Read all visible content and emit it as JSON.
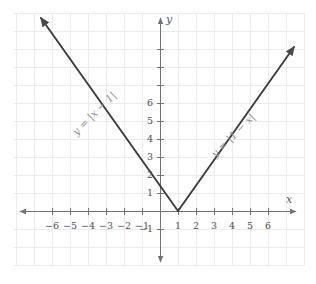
{
  "chart_data": {
    "type": "line",
    "title": "",
    "xlabel": "x",
    "ylabel": "y",
    "xlim": [
      -7.1,
      7.5
    ],
    "ylim": [
      -1.8,
      7.2
    ],
    "grid": true,
    "unit_px": 18,
    "origin_px": {
      "x": 160,
      "y": 211
    },
    "x_ticks": [
      -6,
      -5,
      -4,
      -3,
      -2,
      -1,
      1,
      2,
      3,
      4,
      5,
      6
    ],
    "x_tick_labels": [
      "−6",
      "−5",
      "−4",
      "−3",
      "−2",
      "−1",
      "1",
      "2",
      "3",
      "4",
      "5",
      "6"
    ],
    "y_ticks": [
      -1,
      1,
      2,
      3,
      4,
      5,
      6
    ],
    "y_tick_labels": [
      "−1",
      "1",
      "2",
      "3",
      "4",
      "5",
      "6"
    ],
    "series": [
      {
        "name": "y = |x − 1|",
        "expression": "y = |x - 1|",
        "color": "#3c3c3c",
        "vertex": [
          1,
          0
        ],
        "points": [
          [
            -5.8,
            6.8
          ],
          [
            1,
            0
          ],
          [
            7.5,
            6.5
          ]
        ],
        "arrow_start": true,
        "arrow_end": true
      }
    ],
    "annotations": [
      {
        "id": "eq-left",
        "text": "y = |x − 1|",
        "x": -4.0,
        "y": 4.2,
        "rotation_deg": -45,
        "color": "#8f9397"
      },
      {
        "id": "eq-right",
        "text": "y = |1 − x|",
        "x": 3.1,
        "y": 3.2,
        "rotation_deg": 45,
        "color": "#8f9397"
      }
    ],
    "colors": {
      "grid": "#ececf0",
      "axis": "#6f7479",
      "curve": "#3c3c3c",
      "tick_text": "#4b5055",
      "annotation_text": "#8f9397",
      "background": "#ffffff"
    }
  },
  "axis_labels": {
    "x": "x",
    "y": "y"
  },
  "equations": {
    "left": "y = |x − 1|",
    "right": "y = |1 − x|"
  }
}
